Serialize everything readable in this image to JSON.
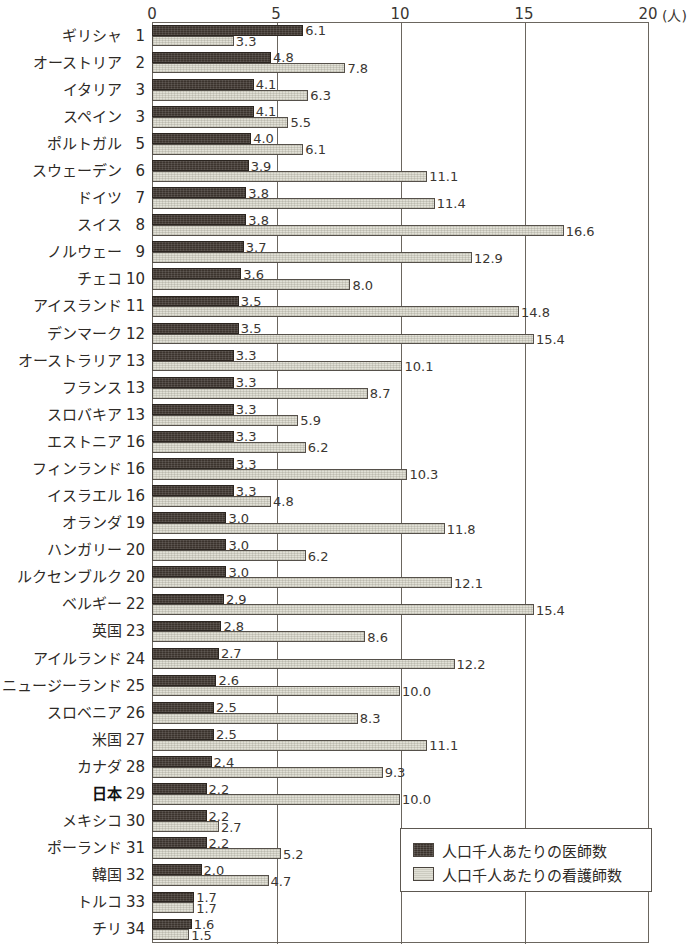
{
  "chart_data": {
    "type": "bar",
    "orientation": "horizontal",
    "title": "",
    "xlabel": "(人)",
    "ylabel": "",
    "xlim": [
      0,
      20
    ],
    "xticks": [
      0,
      5,
      10,
      15,
      20
    ],
    "xtick_labels": [
      "0",
      "5",
      "10",
      "15",
      "20"
    ],
    "grid": true,
    "legend_position": "bottom-right",
    "categories": [
      "ギリシャ",
      "オーストリア",
      "イタリア",
      "スペイン",
      "ポルトガル",
      "スウェーデン",
      "ドイツ",
      "スイス",
      "ノルウェー",
      "チェコ",
      "アイスランド",
      "デンマーク",
      "オーストラリア",
      "フランス",
      "スロバキア",
      "エストニア",
      "フィンランド",
      "イスラエル",
      "オランダ",
      "ハンガリー",
      "ルクセンブルク",
      "ベルギー",
      "英国",
      "アイルランド",
      "ニュージーランド",
      "スロベニア",
      "米国",
      "カナダ",
      "日本",
      "メキシコ",
      "ポーランド",
      "韓国",
      "トルコ",
      "チリ"
    ],
    "ranks": [
      "1",
      "2",
      "3",
      "3",
      "5",
      "6",
      "7",
      "8",
      "9",
      "10",
      "11",
      "12",
      "13",
      "13",
      "13",
      "16",
      "16",
      "16",
      "19",
      "20",
      "20",
      "22",
      "23",
      "24",
      "25",
      "26",
      "27",
      "28",
      "29",
      "30",
      "31",
      "32",
      "33",
      "34"
    ],
    "highlight_category": "日本",
    "series": [
      {
        "name": "人口千人あたりの医師数",
        "color": "#3b332d",
        "values": [
          6.1,
          4.8,
          4.1,
          4.1,
          4.0,
          3.9,
          3.8,
          3.8,
          3.7,
          3.6,
          3.5,
          3.5,
          3.3,
          3.3,
          3.3,
          3.3,
          3.3,
          3.3,
          3.0,
          3.0,
          3.0,
          2.9,
          2.8,
          2.7,
          2.6,
          2.5,
          2.5,
          2.4,
          2.2,
          2.2,
          2.2,
          2.0,
          1.7,
          1.6
        ]
      },
      {
        "name": "人口千人あたりの看護師数",
        "color": "#e1e0d6",
        "values": [
          3.3,
          7.8,
          6.3,
          5.5,
          6.1,
          11.1,
          11.4,
          16.6,
          12.9,
          8.0,
          14.8,
          15.4,
          10.1,
          8.7,
          5.9,
          6.2,
          10.3,
          4.8,
          11.8,
          6.2,
          12.1,
          15.4,
          8.6,
          12.2,
          10.0,
          8.3,
          11.1,
          9.3,
          10.0,
          2.7,
          5.2,
          4.7,
          1.7,
          1.5
        ]
      }
    ]
  },
  "legend": {
    "items": [
      {
        "label": "人口千人あたりの医師数",
        "swatch": "doctors"
      },
      {
        "label": "人口千人あたりの看護師数",
        "swatch": "nurses"
      }
    ]
  }
}
